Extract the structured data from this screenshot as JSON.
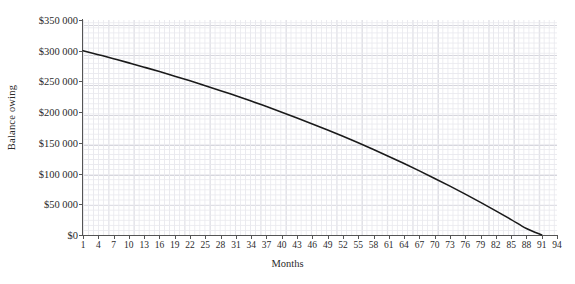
{
  "chart_data": {
    "type": "line",
    "title": "",
    "xlabel": "Months",
    "ylabel": "Balance owing",
    "xlim": [
      1,
      94
    ],
    "ylim": [
      0,
      350000
    ],
    "grid": true,
    "legend": null,
    "x_tick_labels": [
      "1",
      "4",
      "7",
      "10",
      "13",
      "16",
      "19",
      "22",
      "25",
      "28",
      "31",
      "34",
      "37",
      "40",
      "43",
      "46",
      "49",
      "52",
      "55",
      "58",
      "61",
      "64",
      "67",
      "70",
      "73",
      "76",
      "79",
      "82",
      "85",
      "88",
      "91",
      "94"
    ],
    "y_tick_labels": [
      "$0",
      "$50 000",
      "$100 000",
      "$150 000",
      "$200 000",
      "$250 000",
      "$300 000",
      "$350 000"
    ],
    "y_tick_values": [
      0,
      50000,
      100000,
      150000,
      200000,
      250000,
      300000,
      350000
    ],
    "series": [
      {
        "name": "Balance owing",
        "color": "#1a1a1a",
        "x": [
          1,
          4,
          7,
          10,
          13,
          16,
          19,
          22,
          25,
          28,
          31,
          34,
          37,
          40,
          43,
          46,
          49,
          52,
          55,
          58,
          61,
          64,
          67,
          70,
          73,
          76,
          79,
          82,
          85,
          88,
          91,
          94
        ],
        "values": [
          300000,
          293600,
          287000,
          280200,
          273200,
          266000,
          258600,
          251000,
          243100,
          235000,
          226600,
          218000,
          209100,
          200000,
          190600,
          180900,
          170900,
          160600,
          150000,
          139100,
          127900,
          116300,
          104400,
          92100,
          79500,
          66500,
          53100,
          39300,
          25100,
          10500,
          0,
          0
        ]
      }
    ]
  },
  "axis": {
    "y_title": "Balance owing",
    "x_title": "Months"
  },
  "colors": {
    "curve": "#1a1a1a",
    "grid_minor": "#e9e9ee",
    "grid_major": "#d6d6dd",
    "axis": "#555555",
    "text": "#2b2b2b",
    "background": "#ffffff"
  }
}
